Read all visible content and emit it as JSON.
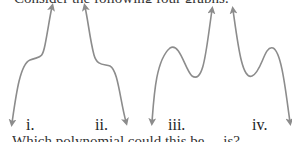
{
  "question": {
    "top_text_partial": "Consider the following four graphs:",
    "bottom_text_partial": "Which polynomial could this be ... is?"
  },
  "graphs": [
    {
      "label": "i.",
      "description": "cubic-like curve, down on left, rising with flat inflection, up on right"
    },
    {
      "label": "ii.",
      "description": "cubic-like curve, up on left, falling with flat inflection, down on right"
    },
    {
      "label": "iii.",
      "description": "quartic/cubic curve, down on left, local max then local min, up on right"
    },
    {
      "label": "iv.",
      "description": "curve up on left, local min then local max, down on right"
    }
  ],
  "style": {
    "curve_color": "#8c8c8c",
    "text_color": "#222222"
  }
}
